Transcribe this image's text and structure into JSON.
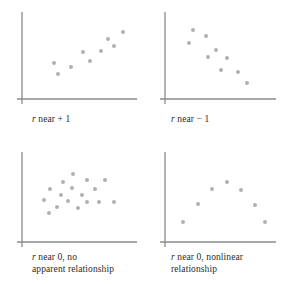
{
  "figure": {
    "background_color": "#ffffff",
    "dot_color": "#b0b0b2",
    "axis_color": "#8a8a8c",
    "text_color": "#2b2b2b",
    "variable_symbol": "r"
  },
  "chart_data": [
    {
      "type": "scatter",
      "panel": "top-left",
      "title": "r near + 1",
      "caption_prefix": "r",
      "caption_rest": " near + 1",
      "description": "Strong positive linear relationship",
      "xlabel": "",
      "ylabel": "",
      "xlim": [
        0,
        100
      ],
      "ylim": [
        0,
        100
      ],
      "grid": false,
      "legend": "none",
      "points": [
        {
          "x": 27,
          "y": 42
        },
        {
          "x": 31,
          "y": 27
        },
        {
          "x": 44,
          "y": 36
        },
        {
          "x": 56,
          "y": 56
        },
        {
          "x": 63,
          "y": 44
        },
        {
          "x": 74,
          "y": 57
        },
        {
          "x": 80,
          "y": 73
        },
        {
          "x": 86,
          "y": 64
        },
        {
          "x": 95,
          "y": 82
        }
      ]
    },
    {
      "type": "scatter",
      "panel": "top-right",
      "title": "r near − 1",
      "caption_prefix": "r",
      "caption_rest": " near − 1",
      "description": "Strong negative linear relationship",
      "xlabel": "",
      "ylabel": "",
      "xlim": [
        0,
        100
      ],
      "ylim": [
        0,
        100
      ],
      "grid": false,
      "legend": "none",
      "points": [
        {
          "x": 24,
          "y": 84
        },
        {
          "x": 20,
          "y": 68
        },
        {
          "x": 36,
          "y": 76
        },
        {
          "x": 46,
          "y": 58
        },
        {
          "x": 38,
          "y": 50
        },
        {
          "x": 57,
          "y": 48
        },
        {
          "x": 51,
          "y": 33
        },
        {
          "x": 68,
          "y": 30
        },
        {
          "x": 76,
          "y": 16
        }
      ]
    },
    {
      "type": "scatter",
      "panel": "bottom-left",
      "title": "r near 0, no apparent relationship",
      "caption_prefix": "r",
      "caption_rest": " near 0, no\napparent relationship",
      "description": "No apparent relationship; random cloud",
      "xlabel": "",
      "ylabel": "",
      "xlim": [
        0,
        100
      ],
      "ylim": [
        0,
        100
      ],
      "grid": false,
      "legend": "none",
      "points": [
        {
          "x": 46,
          "y": 82
        },
        {
          "x": 36,
          "y": 71
        },
        {
          "x": 60,
          "y": 74
        },
        {
          "x": 77,
          "y": 74
        },
        {
          "x": 24,
          "y": 62
        },
        {
          "x": 45,
          "y": 63
        },
        {
          "x": 68,
          "y": 62
        },
        {
          "x": 34,
          "y": 55
        },
        {
          "x": 55,
          "y": 55
        },
        {
          "x": 18,
          "y": 48
        },
        {
          "x": 41,
          "y": 47
        },
        {
          "x": 60,
          "y": 46
        },
        {
          "x": 72,
          "y": 46
        },
        {
          "x": 86,
          "y": 45
        },
        {
          "x": 30,
          "y": 39
        },
        {
          "x": 51,
          "y": 38
        },
        {
          "x": 23,
          "y": 31
        }
      ]
    },
    {
      "type": "scatter",
      "panel": "bottom-right",
      "title": "r near 0, nonlinear relationship",
      "caption_prefix": "r",
      "caption_rest": " near 0, nonlinear\nrelationship",
      "description": "Nonlinear (inverted U) relationship",
      "xlabel": "",
      "ylabel": "",
      "xlim": [
        0,
        100
      ],
      "ylim": [
        0,
        100
      ],
      "grid": false,
      "legend": "none",
      "points": [
        {
          "x": 14,
          "y": 20
        },
        {
          "x": 28,
          "y": 43
        },
        {
          "x": 42,
          "y": 62
        },
        {
          "x": 57,
          "y": 72
        },
        {
          "x": 71,
          "y": 61
        },
        {
          "x": 84,
          "y": 41
        },
        {
          "x": 94,
          "y": 19
        }
      ]
    }
  ]
}
